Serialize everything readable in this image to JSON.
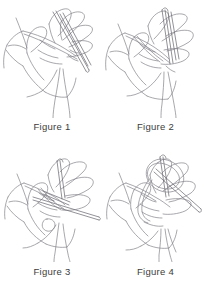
{
  "document": {
    "title": "Knitting Cast-On Instruction Figures",
    "background_color": "#ffffff",
    "ink_color": "#7a7a80",
    "caption_color": "#3b3b3b",
    "layout": "2x2 grid of line-art illustrations with captions beneath each",
    "illustration_subject": "hand holding two knitting needles with yarn loops, pencil line drawing"
  },
  "figures": [
    {
      "id": "figure-1",
      "caption": "Figure 1",
      "description": "Left hand palm facing, fingers spread, two knitting needles crossed in front of the fingers with yarn strands hanging down"
    },
    {
      "id": "figure-2",
      "caption": "Figure 2",
      "description": "Hand gripping the needles closer together, yarn looped over the index finger, strands trailing below"
    },
    {
      "id": "figure-3",
      "caption": "Figure 3",
      "description": "Hand with needles angled to the right, yarn wrapped between fingers, thumb curled under"
    },
    {
      "id": "figure-4",
      "caption": "Figure 4",
      "description": "Hand closed around the needles, yarn loop pulled over the needle tip, strands falling from the fist"
    }
  ]
}
